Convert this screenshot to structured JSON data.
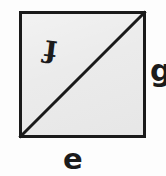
{
  "figure": {
    "kind": "geometry-diagram",
    "background_color": "#ffffff",
    "shape": {
      "name": "square",
      "fill_color": "#ebebeb",
      "stroke_color": "#1a1a1a",
      "stroke_width_px": 3,
      "x_px": 19,
      "y_px": 11,
      "width_px": 127,
      "height_px": 127
    },
    "diagonal": {
      "name": "diagonal-line",
      "stroke_color": "#1a1a1a",
      "stroke_width_px": 3,
      "from": "bottom-left",
      "to": "top-right"
    },
    "labels": [
      {
        "id": "f",
        "text": "f",
        "position": "inside-upper-left-triangle",
        "rotation_deg": 187,
        "font_size_px": 30,
        "color": "#1b1b1b"
      },
      {
        "id": "g",
        "text": "g",
        "position": "right-of-square",
        "clipped_at_image_edge": true,
        "rotation_deg": 0,
        "font_size_px": 30,
        "color": "#1b1b1b"
      },
      {
        "id": "e",
        "text": "e",
        "position": "below-square",
        "rotation_deg": 0,
        "font_size_px": 29,
        "color": "#1b1b1b"
      }
    ]
  }
}
